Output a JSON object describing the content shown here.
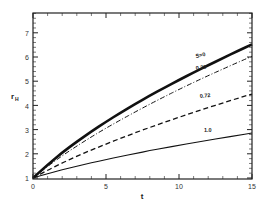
{
  "chart_data": {
    "type": "line",
    "title": "",
    "xlabel": "t",
    "ylabel": "r_H",
    "xlim": [
      0,
      15
    ],
    "ylim": [
      1,
      7.8
    ],
    "xticks": [
      0,
      5,
      10,
      15
    ],
    "yticks": [
      1,
      2,
      3,
      4,
      5,
      6,
      7
    ],
    "grid": false,
    "legend": "inline labels",
    "x": [
      0,
      1,
      2,
      3,
      4,
      5,
      6,
      7,
      8,
      9,
      10,
      11,
      12,
      13,
      14,
      15
    ],
    "series": [
      {
        "name": "S=0",
        "label": "S=0",
        "style": "thick-solid",
        "values": [
          1.0,
          1.55,
          2.05,
          2.5,
          2.92,
          3.32,
          3.7,
          4.06,
          4.4,
          4.73,
          5.05,
          5.36,
          5.66,
          5.95,
          6.24,
          6.52
        ]
      },
      {
        "name": "0.29",
        "label": "0.29",
        "style": "dash-dot",
        "values": [
          1.0,
          1.48,
          1.92,
          2.32,
          2.7,
          3.06,
          3.4,
          3.73,
          4.05,
          4.36,
          4.66,
          4.95,
          5.23,
          5.5,
          5.77,
          6.03
        ]
      },
      {
        "name": "0.72",
        "label": "0.72",
        "style": "dashed",
        "values": [
          1.0,
          1.32,
          1.62,
          1.9,
          2.16,
          2.4,
          2.64,
          2.87,
          3.09,
          3.3,
          3.51,
          3.71,
          3.91,
          4.1,
          4.29,
          4.47
        ]
      },
      {
        "name": "1.0",
        "label": "1.0",
        "style": "thin-solid",
        "values": [
          1.0,
          1.18,
          1.34,
          1.49,
          1.63,
          1.76,
          1.89,
          2.01,
          2.13,
          2.24,
          2.35,
          2.46,
          2.56,
          2.66,
          2.76,
          2.86
        ]
      }
    ]
  },
  "axes": {
    "x_title": "t",
    "y_title": "r",
    "y_title_sub": "H",
    "x_tick_labels": [
      "0",
      "5",
      "10",
      "15"
    ],
    "y_tick_labels": [
      "1",
      "2",
      "3",
      "4",
      "5",
      "6",
      "7"
    ]
  },
  "curve_labels": {
    "s0": "S=0",
    "s029": "0.29",
    "s072": "0.72",
    "s10": "1.0"
  },
  "colors": {
    "line": "#111111",
    "axis": "#222222",
    "background": "#ffffff"
  }
}
